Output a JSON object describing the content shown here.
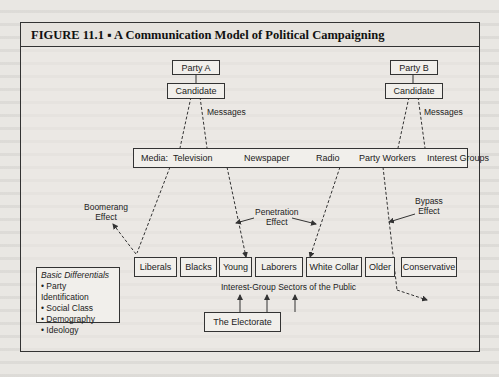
{
  "figure": {
    "title": "FIGURE 11.1 ▪ A Communication Model of Political Campaigning"
  },
  "parties": [
    {
      "party": "Party A",
      "candidate": "Candidate",
      "messages_label": "Messages"
    },
    {
      "party": "Party B",
      "candidate": "Candidate",
      "messages_label": "Messages"
    }
  ],
  "media": {
    "prefix": "Media:",
    "items": [
      "Television",
      "Newspaper",
      "Radio",
      "Party Workers",
      "Interest Groups"
    ]
  },
  "effects": {
    "boomerang": [
      "Boomerang",
      "Effect"
    ],
    "penetration": [
      "Penetration",
      "Effect"
    ],
    "bypass": [
      "Bypass",
      "Effect"
    ]
  },
  "sectors": [
    "Liberals",
    "Blacks",
    "Young",
    "Laborers",
    "White Collar",
    "Older",
    "Conservative"
  ],
  "sectors_caption": "Interest-Group Sectors of the Public",
  "electorate": "The Electorate",
  "basic_differentials": {
    "title": "Basic Differentials",
    "items": [
      "• Party Identification",
      "• Social Class",
      "• Demography",
      "• Ideology"
    ]
  }
}
